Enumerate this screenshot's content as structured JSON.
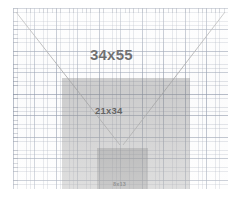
{
  "diagram": {
    "paper": {
      "background_color": "#fdfdfd",
      "fine_grid_color": "#7882 96",
      "coarse_grid_color": "#69768e",
      "fine_grid_spacing_px": 4.3,
      "coarse_grid_spacing_px": 21.5,
      "has_top_ruler": true,
      "has_left_ruler": true
    },
    "rectangles": [
      {
        "id": "outer",
        "label": "34x55",
        "width_units": 34,
        "height_units": 55,
        "fill": "transparent",
        "fill_color": "#ffffff",
        "label_color": "#1b1b1b"
      },
      {
        "id": "mid",
        "label": "21x34",
        "width_units": 21,
        "height_units": 34,
        "fill": "medium-grey",
        "fill_color": "#9a9a9a",
        "label_color": "#1f1f1f"
      },
      {
        "id": "inner",
        "label": "8x13",
        "width_units": 8,
        "height_units": 13,
        "fill": "dark-grey",
        "fill_color": "#7c7c7c",
        "label_color": "#2b2b2b"
      }
    ],
    "diagonals": {
      "description": "Two perspective guide lines from the upper corners converging toward the inner rectangle",
      "color": "#8a8a8a",
      "left_line": {
        "x1": 3,
        "y1": 4,
        "x2": 107,
        "y2": 137
      },
      "right_line": {
        "x1": 212,
        "y1": 4,
        "x2": 110,
        "y2": 137
      }
    },
    "sequence_name": "Fibonacci"
  }
}
